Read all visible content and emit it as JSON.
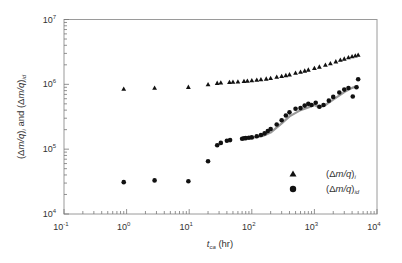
{
  "chart_data": {
    "type": "scatter",
    "title": "",
    "xlabel": "t_ca (hr)",
    "xlabel_main": "t",
    "xlabel_sub": "ca",
    "xlabel_unit": " (hr)",
    "ylabel": "(Δm/q)_i and (Δm/q)_id",
    "xscale": "log",
    "yscale": "log",
    "xlim": [
      0.1,
      10000
    ],
    "ylim": [
      10000,
      10000000
    ],
    "x_ticks": [
      {
        "value": 0.1,
        "base": "10",
        "exp": "-1"
      },
      {
        "value": 1,
        "base": "10",
        "exp": "0"
      },
      {
        "value": 10,
        "base": "10",
        "exp": "1"
      },
      {
        "value": 100,
        "base": "10",
        "exp": "2"
      },
      {
        "value": 1000,
        "base": "10",
        "exp": "3"
      },
      {
        "value": 10000,
        "base": "10",
        "exp": "4"
      }
    ],
    "y_ticks": [
      {
        "value": 10000,
        "base": "10",
        "exp": "4"
      },
      {
        "value": 100000,
        "base": "10",
        "exp": "5"
      },
      {
        "value": 1000000,
        "base": "10",
        "exp": "6"
      },
      {
        "value": 10000000,
        "base": "10",
        "exp": "7"
      }
    ],
    "grid": false,
    "legend_position": "lower right",
    "series": [
      {
        "name": "(Δm/q)_i",
        "label_main": "(Δm/q)",
        "label_sub": "i",
        "marker": "triangle",
        "color": "#111111",
        "x": [
          0.9,
          2.8,
          9.7,
          20,
          28,
          32,
          44,
          50,
          60,
          75,
          85,
          100,
          120,
          140,
          170,
          200,
          250,
          300,
          350,
          400,
          500,
          600,
          700,
          800,
          1000,
          1200,
          1500,
          1800,
          2200,
          2600,
          3000,
          3500,
          4000,
          4500,
          5000
        ],
        "y": [
          850000,
          880000,
          910000,
          1000000,
          1050000,
          1060000,
          1080000,
          1090000,
          1100000,
          1120000,
          1130000,
          1150000,
          1170000,
          1190000,
          1220000,
          1250000,
          1300000,
          1340000,
          1380000,
          1420000,
          1500000,
          1560000,
          1620000,
          1680000,
          1780000,
          1870000,
          2000000,
          2100000,
          2250000,
          2380000,
          2480000,
          2600000,
          2700000,
          2780000,
          2850000
        ]
      },
      {
        "name": "(Δm/q)_id",
        "label_main": "(Δm/q)",
        "label_sub": "id",
        "marker": "circle",
        "color": "#111111",
        "x": [
          0.9,
          2.8,
          9.7,
          20,
          28,
          32,
          40,
          45,
          70,
          75,
          80,
          90,
          100,
          120,
          140,
          160,
          180,
          200,
          250,
          300,
          350,
          400,
          500,
          600,
          700,
          800,
          900,
          1050,
          1200,
          1400,
          1700,
          2000,
          2500,
          3000,
          3500,
          4100,
          4700,
          5000
        ],
        "y": [
          31000,
          33000,
          32000,
          65000,
          115000,
          125000,
          135000,
          138000,
          145000,
          147000,
          148000,
          150000,
          152000,
          158000,
          165000,
          175000,
          190000,
          205000,
          240000,
          280000,
          330000,
          370000,
          420000,
          430000,
          470000,
          500000,
          480000,
          520000,
          450000,
          480000,
          560000,
          640000,
          750000,
          830000,
          880000,
          650000,
          900000,
          1200000
        ]
      }
    ],
    "overlay_line": {
      "name": "gray trend",
      "color": "#999999",
      "x": [
        100,
        150,
        200,
        300,
        400,
        600,
        800,
        1000,
        1200,
        1500,
        2000,
        3000,
        4000,
        5000
      ],
      "y": [
        150000,
        160000,
        180000,
        250000,
        320000,
        400000,
        440000,
        480000,
        440000,
        480000,
        580000,
        760000,
        880000,
        950000
      ]
    }
  }
}
